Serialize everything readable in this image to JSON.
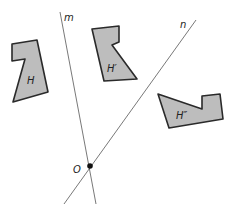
{
  "diagram": {
    "lines": [
      {
        "id": "m",
        "label": "m",
        "x1": 60,
        "y1": 12,
        "x2": 96,
        "y2": 204,
        "label_x": 64,
        "label_y": 21
      },
      {
        "id": "n",
        "label": "n",
        "x1": 196,
        "y1": 20,
        "x2": 64,
        "y2": 204,
        "label_x": 180,
        "label_y": 28
      }
    ],
    "point": {
      "label": "O",
      "x": 90,
      "y": 166,
      "label_x": 73,
      "label_y": 173
    },
    "shapes": [
      {
        "id": "H",
        "label": "H",
        "points": "12,44 37,40 48,92 13,102 25,59 12,61",
        "label_x": 27,
        "label_y": 84
      },
      {
        "id": "H-prime",
        "label": "H′",
        "points": "92,29 119,26 119,42 112,45 137,79 104,81",
        "label_x": 107,
        "label_y": 72
      },
      {
        "id": "H-double-prime",
        "label": "H″",
        "points": "158,94 202,109 202,96 220,94 223,119 169,128",
        "label_x": 176,
        "label_y": 119
      }
    ],
    "colors": {
      "fill": "#bdbdbd",
      "stroke": "#2a2a2a",
      "line": "#555555"
    }
  }
}
